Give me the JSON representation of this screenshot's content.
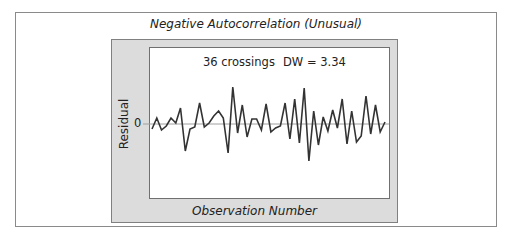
{
  "chart_data": {
    "type": "line",
    "title": "Negative Autocorrelation (Unusual)",
    "xlabel": "Observation Number",
    "ylabel": "Residual",
    "y_tick_labels": [
      "0"
    ],
    "annotations": [
      "36 crossings",
      "DW = 3.34"
    ],
    "grid": false,
    "legend": null,
    "reference_line": {
      "y": 0,
      "color": "#a0a0a0"
    },
    "x": [
      1,
      2,
      3,
      4,
      5,
      6,
      7,
      8,
      9,
      10,
      11,
      12,
      13,
      14,
      15,
      16,
      17,
      18,
      19,
      20,
      21,
      22,
      23,
      24,
      25,
      26,
      27,
      28,
      29,
      30,
      31,
      32,
      33,
      34,
      35,
      36,
      37,
      38,
      39,
      40,
      41,
      42,
      43,
      44,
      45,
      46,
      47,
      48,
      49,
      50
    ],
    "series": [
      {
        "name": "Residual",
        "color": "#333333",
        "values": [
          -0.5,
          0.6,
          -0.6,
          -0.2,
          0.6,
          0.1,
          1.6,
          -2.7,
          -0.5,
          -0.3,
          2.1,
          -0.3,
          0.1,
          0.8,
          1.3,
          0.6,
          -2.9,
          3.7,
          -0.9,
          1.9,
          -1.3,
          0.5,
          0.5,
          -0.6,
          2.0,
          -0.8,
          -0.4,
          -0.2,
          2.1,
          -1.5,
          2.5,
          -1.9,
          3.6,
          -3.7,
          1.3,
          -2.1,
          0.7,
          -0.7,
          1.4,
          -0.4,
          2.5,
          -2.0,
          1.3,
          -1.8,
          -1.2,
          2.8,
          -1.0,
          1.9,
          -0.8,
          0.2
        ]
      }
    ],
    "ylim": [
      -7.5,
      7.5
    ]
  },
  "labels": {
    "title": "Negative Autocorrelation (Unusual)",
    "title_main": "Negative Autocorrelation (",
    "title_italic_inner": "Unusual",
    "title_end": ")",
    "crossings": "36 crossings",
    "dw": "DW = 3.34",
    "ylabel": "Residual",
    "ytick_zero": "0",
    "xlabel": "Observation Number"
  },
  "colors": {
    "panel_fill": "#dcdcdc",
    "line": "#333333",
    "zero_line": "#a0a0a0",
    "border": "#808080"
  }
}
